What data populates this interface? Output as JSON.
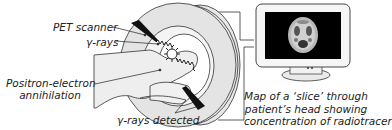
{
  "diagram": {
    "title": "PET scan",
    "labels": {
      "pet_scanner": "PET scanner",
      "gamma_rays": "γ-rays",
      "annihilation_line1": "Positron-electron",
      "annihilation_line2": "annihilation",
      "gamma_detected": "γ-rays detected",
      "map_line1": "Map of a ‘slice’ through",
      "map_line2": "patient’s head showing",
      "map_line3": "concentration of radiotracer"
    },
    "components": [
      "scanner-ring",
      "patient-body",
      "monitor",
      "brain-scan-image",
      "cable"
    ],
    "colors": {
      "ring_fill": "#e6e6e6",
      "outline": "#333333",
      "screen": "#000000",
      "detector": "#111111"
    }
  }
}
